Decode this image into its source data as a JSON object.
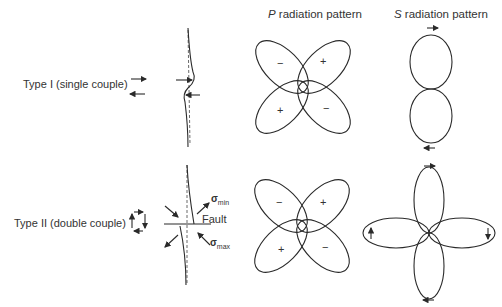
{
  "headers": {
    "p_pattern": {
      "letter": "P",
      "text": " radiation pattern"
    },
    "s_pattern": {
      "letter": "S",
      "text": " radiation pattern"
    }
  },
  "rows": [
    {
      "label": "Type I (single couple)"
    },
    {
      "label": "Type II (double couple)"
    }
  ],
  "fault_diagram": {
    "fault_label": "Fault",
    "sigma": "σ",
    "sigma_min_sub": "min",
    "sigma_max_sub": "max"
  },
  "p_pattern_signs": {
    "upper_left": "−",
    "upper_right": "+",
    "lower_left": "+",
    "lower_right": "−"
  },
  "colors": {
    "line": "#2a2a2a",
    "background": "#ffffff"
  }
}
